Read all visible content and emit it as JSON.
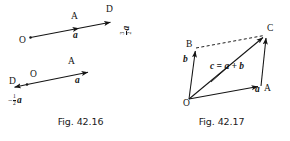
{
  "document": {
    "kind": "textbook-vector-diagrams",
    "background_color": "#ffffff",
    "ink_color": "#141414"
  },
  "figures": [
    {
      "id": "fig-42-16",
      "caption": "Fig. 42.16",
      "description": "Scalar multiplication of a vector",
      "diagrams": [
        {
          "id": "fig-42-16-top",
          "points": [
            {
              "name": "O",
              "label": "O"
            },
            {
              "name": "A",
              "label": "A"
            },
            {
              "name": "D",
              "label": "D"
            }
          ],
          "vectors": [
            {
              "name": "a",
              "label": "a",
              "from": "O",
              "to": "A"
            },
            {
              "name": "three-halves-a",
              "label_numerator": "3",
              "label_denominator": "2",
              "label_symbol": "a",
              "label_sign": "",
              "from": "O",
              "to": "D"
            }
          ]
        },
        {
          "id": "fig-42-16-bottom",
          "points": [
            {
              "name": "O",
              "label": "O"
            },
            {
              "name": "A",
              "label": "A"
            },
            {
              "name": "D",
              "label": "D"
            }
          ],
          "vectors": [
            {
              "name": "a",
              "label": "a",
              "from": "O",
              "to": "A"
            },
            {
              "name": "minus-half-a",
              "label_numerator": "1",
              "label_denominator": "2",
              "label_symbol": "a",
              "label_sign": "−",
              "from": "O",
              "to": "D"
            }
          ]
        }
      ]
    },
    {
      "id": "fig-42-17",
      "caption": "Fig. 42.17",
      "description": "Parallelogram law of vector addition",
      "points": [
        {
          "name": "O",
          "label": "O"
        },
        {
          "name": "A",
          "label": "A"
        },
        {
          "name": "B",
          "label": "B"
        },
        {
          "name": "C",
          "label": "C"
        }
      ],
      "vectors": [
        {
          "name": "a",
          "label": "a",
          "from": "O",
          "to": "A",
          "style": "solid"
        },
        {
          "name": "b",
          "label": "b",
          "from": "O",
          "to": "B",
          "style": "solid"
        },
        {
          "name": "c",
          "label": "c",
          "from": "O",
          "to": "C",
          "style": "solid"
        }
      ],
      "construction_lines": [
        {
          "name": "B-to-C",
          "from": "B",
          "to": "C",
          "style": "dashed"
        },
        {
          "name": "A-to-C",
          "from": "A",
          "to": "C",
          "style": "solid"
        }
      ],
      "equation": "c = a + b"
    }
  ]
}
